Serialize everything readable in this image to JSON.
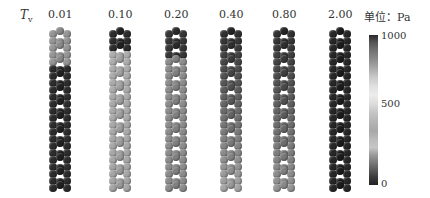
{
  "figure": {
    "row_label_symbol": "T",
    "row_label_sub": "v",
    "unit_label": "单位：Pa",
    "columns": [
      {
        "label": "0.01",
        "center_x": 60
      },
      {
        "label": "0.10",
        "center_x": 120
      },
      {
        "label": "0.20",
        "center_x": 176
      },
      {
        "label": "0.40",
        "center_x": 231
      },
      {
        "label": "0.80",
        "center_x": 284
      },
      {
        "label": "2.00",
        "center_x": 340
      }
    ],
    "colorbar": {
      "max_label": "1000",
      "mid_label": "500",
      "min_label": "0",
      "min": 0,
      "max": 1000
    }
  },
  "shade_profiles": {
    "description": "per-column gray level by row (top to bottom, 0=black,255=white)",
    "0.01": "light top ~5 rows, dark rest",
    "0.10": "dark top ~3 rows, light rest",
    "0.20": "dark top ~4 rows, mid-gray rest",
    "0.40": "dark top, gradually lighter downward",
    "0.80": "dark top, gradually lighter downward",
    "2.00": "uniformly dark"
  }
}
